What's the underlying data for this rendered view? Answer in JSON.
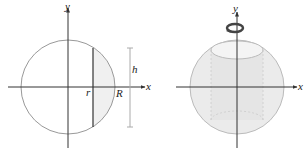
{
  "left_figure": {
    "axis_x_label": "x",
    "axis_y_label": "y",
    "label_r": "r",
    "label_R": "R",
    "label_h": "h"
  },
  "right_figure": {
    "axis_x_label": "x",
    "axis_y_label": "y",
    "rotation_icon": "rotation-arrow-icon"
  },
  "colors": {
    "circle_stroke": "#999999",
    "shade_fill": "#f0f0f0",
    "axis": "#333333",
    "sphere_fill": "#e8e8e8"
  }
}
